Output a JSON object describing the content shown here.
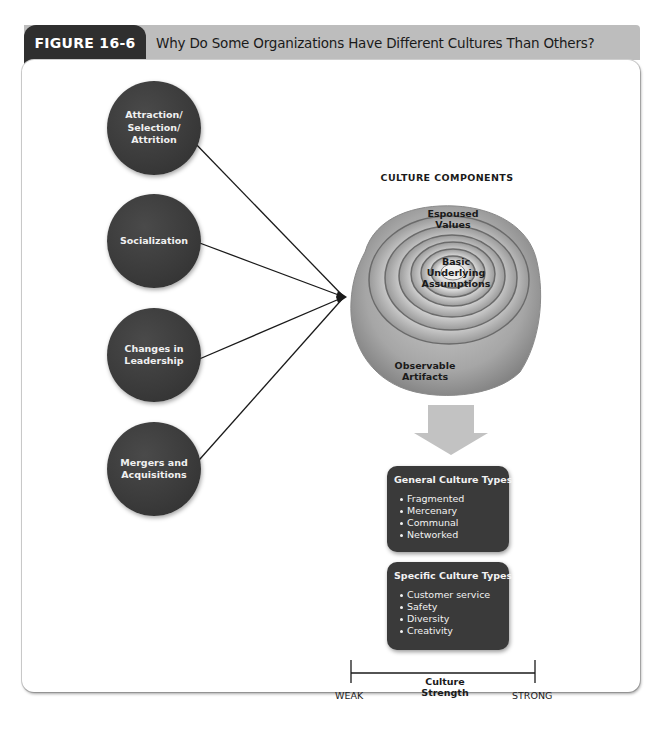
{
  "header": {
    "figure_label": "FIGURE 16-6",
    "title": "Why Do Some Organizations Have Different Cultures Than Others?"
  },
  "factors": [
    {
      "label": "Attraction/\nSelection/\nAttrition"
    },
    {
      "label": "Socialization"
    },
    {
      "label": "Changes in\nLeadership"
    },
    {
      "label": "Mergers and\nAcquisitions"
    }
  ],
  "culture_components": {
    "heading": "CULTURE COMPONENTS",
    "layers": [
      {
        "label": "Espoused\nValues"
      },
      {
        "label": "Basic\nUnderlying\nAssumptions"
      },
      {
        "label": "Observable\nArtifacts"
      }
    ]
  },
  "general_types": {
    "title": "General Culture Types",
    "items": [
      "Fragmented",
      "Mercenary",
      "Communal",
      "Networked"
    ]
  },
  "specific_types": {
    "title": "Specific Culture Types",
    "items": [
      "Customer service",
      "Safety",
      "Diversity",
      "Creativity"
    ]
  },
  "strength_scale": {
    "title": "Culture Strength",
    "low": "WEAK",
    "high": "STRONG"
  },
  "colors": {
    "dark": "#3a3a3a",
    "header_gray": "#bdbdbd",
    "tab_dark": "#2f2f2f"
  }
}
